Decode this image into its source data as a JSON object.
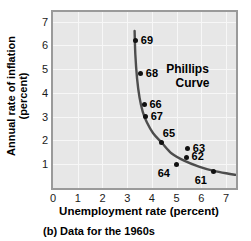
{
  "chart_data": {
    "type": "scatter",
    "title": "",
    "xlabel": "Unemployment rate (percent)",
    "ylabel": "Annual rate of inflation\n(percent)",
    "caption": "(b) Data for the 1960s",
    "annotation": {
      "line1": "Phillips",
      "line2": "Curve"
    },
    "xlim": [
      0,
      7.4
    ],
    "ylim": [
      0,
      7.4
    ],
    "xticks": [
      0,
      1,
      2,
      3,
      4,
      5,
      6,
      7
    ],
    "yticks": [
      1,
      2,
      3,
      4,
      5,
      6,
      7
    ],
    "grid": true,
    "legend": "none",
    "point_label_field": "year",
    "points": [
      {
        "year": "69",
        "x": 3.35,
        "y": 6.2,
        "label_pos": "right"
      },
      {
        "year": "68",
        "x": 3.55,
        "y": 4.8,
        "label_pos": "right"
      },
      {
        "year": "66",
        "x": 3.7,
        "y": 3.5,
        "label_pos": "right"
      },
      {
        "year": "67",
        "x": 3.75,
        "y": 3.0,
        "label_pos": "right"
      },
      {
        "year": "65",
        "x": 4.4,
        "y": 1.9,
        "label_pos": "above-right"
      },
      {
        "year": "63",
        "x": 5.45,
        "y": 1.65,
        "label_pos": "right"
      },
      {
        "year": "62",
        "x": 5.4,
        "y": 1.3,
        "label_pos": "right"
      },
      {
        "year": "64",
        "x": 5.0,
        "y": 1.0,
        "label_pos": "below-left"
      },
      {
        "year": "61",
        "x": 6.5,
        "y": 0.7,
        "label_pos": "below-left"
      }
    ],
    "curve": {
      "description": "downward-sloping convex Phillips curve through the 1960s points",
      "points": [
        [
          3.3,
          6.6
        ],
        [
          3.33,
          5.6
        ],
        [
          3.4,
          4.6
        ],
        [
          3.5,
          3.8
        ],
        [
          3.63,
          3.2
        ],
        [
          3.8,
          2.75
        ],
        [
          4.05,
          2.3
        ],
        [
          4.4,
          1.9
        ],
        [
          4.8,
          1.45
        ],
        [
          5.3,
          1.15
        ],
        [
          5.9,
          0.9
        ],
        [
          6.5,
          0.72
        ],
        [
          7.1,
          0.6
        ],
        [
          7.4,
          0.55
        ]
      ],
      "color": "#4d4d4d"
    },
    "colors": {
      "plot_background": "#e7e7e7",
      "gridline": "#f7f7f7",
      "axis": "#9a9a9a",
      "point": "#111111",
      "curve": "#4d4d4d",
      "text": "#000000"
    }
  }
}
